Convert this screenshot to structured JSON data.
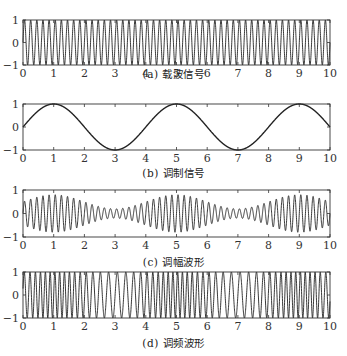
{
  "chart_data": [
    {
      "type": "line",
      "caption": "(a) 载波信号",
      "title": "载波信号",
      "label": "(a)",
      "xlabel": "",
      "ylabel": "",
      "xlim": [
        0,
        10
      ],
      "ylim": [
        -1,
        1
      ],
      "xticks": [
        0,
        1,
        2,
        3,
        4,
        5,
        6,
        7,
        8,
        9,
        10
      ],
      "yticks": [
        -1,
        0,
        1
      ],
      "grid": false,
      "function": "sin(2*pi*5*t)",
      "carrier_freq": 5
    },
    {
      "type": "line",
      "caption": "(b) 调制信号",
      "title": "调制信号",
      "label": "(b)",
      "xlim": [
        0,
        10
      ],
      "ylim": [
        -1,
        1
      ],
      "xticks": [
        0,
        1,
        2,
        3,
        4,
        5,
        6,
        7,
        8,
        9,
        10
      ],
      "yticks": [
        -1,
        0,
        1
      ],
      "grid": false,
      "function": "sin(2*pi*0.25*t)",
      "x": [
        0,
        1,
        2,
        3,
        4,
        5,
        6,
        7,
        8,
        9,
        10
      ],
      "values": [
        0,
        1,
        0,
        -1,
        0,
        1,
        0,
        -1,
        0,
        1,
        0
      ]
    },
    {
      "type": "line",
      "caption": "(c) 调幅波形",
      "title": "调幅波形",
      "label": "(c)",
      "xlim": [
        0,
        10
      ],
      "ylim": [
        -1,
        1
      ],
      "xticks": [
        0,
        1,
        2,
        3,
        4,
        5,
        6,
        7,
        8,
        9,
        10
      ],
      "yticks": [
        -1,
        0,
        1
      ],
      "grid": false,
      "function": "(0.5+0.3*sin(2*pi*0.25*t))*sin(2*pi*5*t)",
      "envelope_max": 0.8,
      "envelope_min": 0.2
    },
    {
      "type": "line",
      "caption": "(d) 调频波形",
      "title": "调频波形",
      "label": "(d)",
      "xlim": [
        0,
        10
      ],
      "ylim": [
        -1,
        1
      ],
      "xticks": [
        0,
        1,
        2,
        3,
        4,
        5,
        6,
        7,
        8,
        9,
        10
      ],
      "yticks": [
        -1,
        0,
        1
      ],
      "grid": false,
      "function": "sin(2*pi*5*t - k*cos(2*pi*0.25*t))",
      "note": "frequency highest near t=1,5,9; lowest near t=3,7"
    }
  ],
  "captions": {
    "a": "(a) 载波信号",
    "b": "(b) 调制信号",
    "c": "(c) 调幅波形",
    "d": "(d) 调频波形"
  }
}
